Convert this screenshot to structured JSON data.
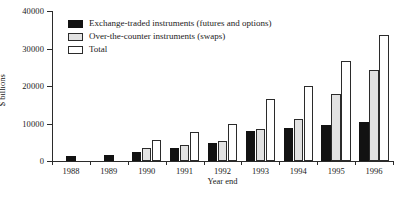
{
  "chart_data": {
    "type": "bar",
    "title": "",
    "xlabel": "Year end",
    "ylabel": "$ billions",
    "ylim": [
      0,
      40000
    ],
    "yticks": [
      "0",
      "10000",
      "20000",
      "30000",
      "40000"
    ],
    "ytick_values": [
      0,
      10000,
      20000,
      30000,
      40000
    ],
    "grid": false,
    "legend_position": "top-left",
    "categories": [
      "1988",
      "1989",
      "1990",
      "1991",
      "1992",
      "1993",
      "1994",
      "1995",
      "1996"
    ],
    "series": [
      {
        "name": "Exchange-traded instruments (futures and options)",
        "key": "exch",
        "color": "#121212",
        "values": [
          1300,
          1600,
          2300,
          3600,
          4800,
          8000,
          8900,
          9600,
          10400
        ]
      },
      {
        "name": "Over-the-counter instruments (swaps)",
        "key": "otc",
        "color": "#e2e2e2",
        "values": [
          null,
          null,
          3500,
          4400,
          5300,
          8500,
          11300,
          17800,
          24300
        ]
      },
      {
        "name": "Total",
        "key": "total",
        "color": "#ffffff",
        "values": [
          null,
          null,
          5700,
          7700,
          10000,
          16500,
          20000,
          26700,
          33700
        ]
      }
    ]
  }
}
